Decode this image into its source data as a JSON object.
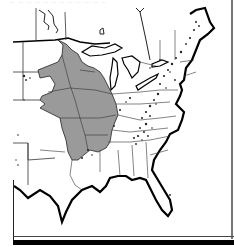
{
  "figure": {
    "title_fragment": "— — — — — — — — — — — —",
    "map": {
      "region": "Eastern United States",
      "shaded_region_color": "#9a9a9a",
      "outline_color": "#000000",
      "stipple_color": "#222222",
      "background_color": "#ffffff"
    }
  }
}
